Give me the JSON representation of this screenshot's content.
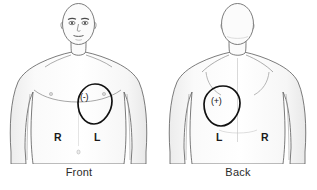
{
  "figure": {
    "type": "anatomical-electrode-placement-diagram",
    "background_color": "#ffffff",
    "outline_color": "#4a4a4a",
    "shade_color": "#f2f2f2",
    "marker_color": "#111111",
    "text_color": "#2b2b2b"
  },
  "panels": [
    {
      "id": "front",
      "caption": "Front",
      "view": "anterior",
      "figure_description": "bald male torso, head, shoulders, arms and waist, front facing",
      "electrode": {
        "polarity_label": "(-)",
        "polarity": "negative",
        "region": "left anterior chest",
        "shape": "teardrop-oval",
        "center_px": [
          95,
          103
        ]
      },
      "side_labels": [
        {
          "text": "R",
          "position": "viewer-left",
          "meaning": "patient right"
        },
        {
          "text": "L",
          "position": "viewer-right",
          "meaning": "patient left"
        }
      ]
    },
    {
      "id": "back",
      "caption": "Back",
      "view": "posterior",
      "figure_description": "bald male torso, head, shoulders, arms and waist, seen from behind",
      "electrode": {
        "polarity_label": "(+)",
        "polarity": "positive",
        "region": "left posterior back",
        "shape": "teardrop-oval",
        "center_px": [
          215,
          106
        ]
      },
      "side_labels": [
        {
          "text": "L",
          "position": "viewer-left",
          "meaning": "patient left"
        },
        {
          "text": "R",
          "position": "viewer-right",
          "meaning": "patient right"
        }
      ]
    }
  ]
}
